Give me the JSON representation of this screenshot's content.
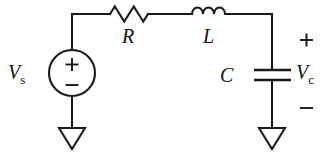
{
  "figure": {
    "name": "series-rlc-circuit",
    "background_color": "#ffffff",
    "line_color": "#1a1a1a"
  },
  "labels": {
    "source": "V",
    "source_sub": "s",
    "resistor": "R",
    "inductor": "L",
    "capacitor": "C",
    "output": "V",
    "output_sub": "c"
  },
  "polarity": {
    "source_plus": "+",
    "source_minus": "−",
    "output_plus": "+",
    "output_minus": "−"
  },
  "components": [
    {
      "id": "voltage-source",
      "symbol": "circle-with-plus-minus",
      "label": "Vs"
    },
    {
      "id": "resistor",
      "symbol": "zigzag",
      "label": "R"
    },
    {
      "id": "inductor",
      "symbol": "coil-humps",
      "label": "L"
    },
    {
      "id": "capacitor",
      "symbol": "parallel-plates",
      "label": "C"
    },
    {
      "id": "ground-left",
      "symbol": "open-triangle",
      "label": ""
    },
    {
      "id": "ground-right",
      "symbol": "open-triangle",
      "label": ""
    }
  ]
}
